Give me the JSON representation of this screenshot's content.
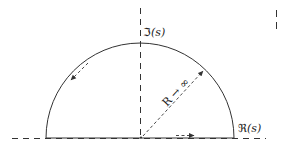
{
  "diagram": {
    "type": "contour-diagram",
    "colors": {
      "stroke": "#333333",
      "background": "#ffffff"
    },
    "axes": {
      "real": {
        "label_prefix": "ℜ",
        "label_arg": "(s)"
      },
      "imaginary": {
        "label_prefix": "ℑ",
        "label_arg": "(s)"
      }
    },
    "radius_label": "R → ∞",
    "arrows": {
      "arc_direction": "counter-clockwise",
      "axis_direction": "right"
    }
  }
}
